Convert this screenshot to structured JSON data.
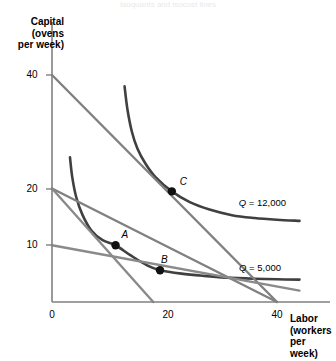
{
  "figure": {
    "kind": "isoquant-isocost-diagram",
    "background_color": "#ffffff",
    "faint_header_text": "Isoquants and isocost lines"
  },
  "axes": {
    "y_axis": {
      "title": "Capital\n(ovens\nper week)",
      "ticks": [
        "40",
        "20",
        "10",
        "0"
      ],
      "tick_values": [
        40,
        20,
        10,
        0
      ],
      "range": [
        0,
        44
      ]
    },
    "x_axis": {
      "title": "Labor\n(workers\nper week)",
      "ticks": [
        "0",
        "20",
        "40"
      ],
      "tick_values": [
        0,
        20,
        40
      ],
      "range": [
        0,
        44
      ]
    },
    "axis_color": "#808080"
  },
  "points": [
    {
      "label": "A",
      "x": 11.3,
      "y": 10.0,
      "color": "#111111",
      "label_dx": 6,
      "label_dy": -16
    },
    {
      "label": "B",
      "x": 19.2,
      "y": 5.6,
      "color": "#111111",
      "label_dx": 1,
      "label_dy": -16
    },
    {
      "label": "C",
      "x": 21.3,
      "y": 19.5,
      "color": "#111111",
      "label_dx": 8,
      "label_dy": -15
    }
  ],
  "curve_labels": [
    {
      "text": "Q = 12,000",
      "q_symbol": "Q",
      "rest": " = 12,000",
      "x": 286,
      "y": 197
    },
    {
      "text": "Q = 5,000",
      "q_symbol": "Q",
      "rest": " = 5,000",
      "x": 281,
      "y": 262
    }
  ],
  "chart_data": {
    "type": "line",
    "title": "",
    "xlabel": "Labor (workers per week)",
    "ylabel": "Capital (ovens per week)",
    "xlim": [
      0,
      44
    ],
    "ylim": [
      0,
      44
    ],
    "grid": false,
    "legend_position": "inline-right",
    "series": [
      {
        "name": "Q = 12,000",
        "role": "isoquant",
        "color": "#404040",
        "width": 2.6,
        "points": [
          [
            12.9,
            38.0
          ],
          [
            13.4,
            34.0
          ],
          [
            14.2,
            30.0
          ],
          [
            15.2,
            27.0
          ],
          [
            16.6,
            24.4
          ],
          [
            18.4,
            22.0
          ],
          [
            21.3,
            19.5
          ],
          [
            24.5,
            17.6
          ],
          [
            28.0,
            16.3
          ],
          [
            32.0,
            15.3
          ],
          [
            36.0,
            14.8
          ],
          [
            40.0,
            14.5
          ],
          [
            44.0,
            14.3
          ]
        ]
      },
      {
        "name": "Q = 5,000",
        "role": "isoquant",
        "color": "#404040",
        "width": 2.6,
        "points": [
          [
            3.2,
            25.5
          ],
          [
            3.6,
            22.0
          ],
          [
            4.3,
            18.5
          ],
          [
            5.4,
            15.4
          ],
          [
            7.0,
            12.6
          ],
          [
            9.0,
            10.9
          ],
          [
            11.3,
            10.0
          ],
          [
            14.0,
            8.2
          ],
          [
            17.0,
            6.4
          ],
          [
            19.2,
            5.6
          ],
          [
            23.0,
            5.0
          ],
          [
            27.0,
            4.6
          ],
          [
            31.0,
            4.3
          ],
          [
            36.0,
            4.1
          ],
          [
            40.0,
            4.0
          ],
          [
            44.0,
            3.95
          ]
        ]
      },
      {
        "name": "isocost-high",
        "role": "isocost",
        "color": "#808080",
        "width": 2.4,
        "points": [
          [
            0,
            40
          ],
          [
            40,
            0
          ]
        ],
        "intercepts": {
          "capital": 40,
          "labor": 40
        }
      },
      {
        "name": "isocost-mid",
        "role": "isocost",
        "color": "#808080",
        "width": 2.4,
        "points": [
          [
            0,
            20
          ],
          [
            40,
            0
          ]
        ],
        "intercepts": {
          "capital": 20,
          "labor": 40
        }
      },
      {
        "name": "isocost-low",
        "role": "isocost",
        "color": "#8a8a8a",
        "width": 2.4,
        "points": [
          [
            0,
            20
          ],
          [
            18,
            0
          ]
        ],
        "intercepts": {
          "capital": 20,
          "labor": 18
        }
      },
      {
        "name": "isocost-flat",
        "role": "isocost",
        "color": "#8a8a8a",
        "width": 2.4,
        "points": [
          [
            0,
            10
          ],
          [
            44,
            2.0
          ]
        ],
        "intercepts": {
          "capital": 10,
          "labor": null
        }
      }
    ],
    "annotations": [
      {
        "text": "A",
        "x": 11.3,
        "y": 10.0
      },
      {
        "text": "B",
        "x": 19.2,
        "y": 5.6
      },
      {
        "text": "C",
        "x": 21.3,
        "y": 19.5
      }
    ]
  }
}
